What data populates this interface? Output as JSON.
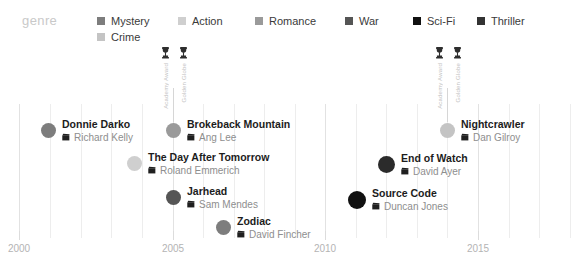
{
  "legend": {
    "title": "genre",
    "items": [
      {
        "label": "Mystery",
        "color": "#7d7d7d",
        "x": 97,
        "y": 15
      },
      {
        "label": "Action",
        "color": "#cfcfcf",
        "x": 178,
        "y": 15
      },
      {
        "label": "Romance",
        "color": "#9a9a9a",
        "x": 255,
        "y": 15
      },
      {
        "label": "War",
        "color": "#555555",
        "x": 345,
        "y": 15
      },
      {
        "label": "Sci-Fi",
        "color": "#111111",
        "x": 413,
        "y": 15
      },
      {
        "label": "Thriller",
        "color": "#333333",
        "x": 477,
        "y": 15
      },
      {
        "label": "Crime",
        "color": "#c4c4c4",
        "x": 97,
        "y": 31
      }
    ]
  },
  "axis": {
    "ticks": [
      {
        "label": "2000",
        "x": 19
      },
      {
        "label": "2005",
        "x": 173
      },
      {
        "label": "2010",
        "x": 325
      },
      {
        "label": "2015",
        "x": 478
      }
    ],
    "minor_gridlines": [
      19,
      50,
      81,
      111,
      142,
      173,
      203,
      234,
      264,
      295,
      325,
      356,
      386,
      417,
      447,
      478,
      509,
      539,
      570
    ]
  },
  "awards": [
    {
      "x": 173,
      "stem_top": 88,
      "stem_height": 34,
      "items_top": 46,
      "entries": [
        {
          "icon": "trophy-icon",
          "label": "Academy Award"
        },
        {
          "icon": "trophy-icon",
          "label": "Golden Globe"
        }
      ]
    },
    {
      "x": 447,
      "stem_top": 88,
      "stem_height": 34,
      "items_top": 46,
      "entries": [
        {
          "icon": "trophy-icon",
          "label": "Academy Award"
        },
        {
          "icon": "trophy-icon",
          "label": "Golden Globe"
        }
      ]
    }
  ],
  "films": [
    {
      "title": "Donnie Darko",
      "director": "Richard Kelly",
      "genre": "Mystery",
      "color": "#7d7d7d",
      "size": 15,
      "x": 41,
      "y": 119
    },
    {
      "title": "Brokeback Mountain",
      "director": "Ang Lee",
      "genre": "Romance",
      "color": "#9a9a9a",
      "size": 15,
      "x": 166,
      "y": 119
    },
    {
      "title": "The Day After Tomorrow",
      "director": "Roland Emmerich",
      "genre": "Action",
      "color": "#cfcfcf",
      "size": 15,
      "x": 127,
      "y": 152
    },
    {
      "title": "Jarhead",
      "director": "Sam Mendes",
      "genre": "War",
      "color": "#555555",
      "size": 15,
      "x": 166,
      "y": 186
    },
    {
      "title": "Zodiac",
      "director": "David Fincher",
      "genre": "Mystery",
      "color": "#7d7d7d",
      "size": 15,
      "x": 216,
      "y": 216
    },
    {
      "title": "Nightcrawler",
      "director": "Dan Gilroy",
      "genre": "Crime",
      "color": "#c4c4c4",
      "size": 15,
      "x": 440,
      "y": 119
    },
    {
      "title": "End of Watch",
      "director": "David Ayer",
      "genre": "Thriller",
      "color": "#2b2b2b",
      "size": 17,
      "x": 378,
      "y": 153
    },
    {
      "title": "Source Code",
      "director": "Duncan Jones",
      "genre": "Sci-Fi",
      "color": "#111111",
      "size": 18,
      "x": 348,
      "y": 188
    }
  ],
  "chart_data": {
    "type": "scatter",
    "title": "",
    "xlabel": "",
    "ylabel": "",
    "xlim": [
      1999,
      2016
    ],
    "grid": true,
    "legend_position": "top",
    "legend_title": "genre",
    "categories": [
      "Mystery",
      "Action",
      "Romance",
      "War",
      "Sci-Fi",
      "Thriller",
      "Crime"
    ],
    "x_tick_labels": [
      "2000",
      "2005",
      "2010",
      "2015"
    ],
    "points": [
      {
        "label": "Donnie Darko",
        "director": "Richard Kelly",
        "genre": "Mystery",
        "year": 2001
      },
      {
        "label": "Brokeback Mountain",
        "director": "Ang Lee",
        "genre": "Romance",
        "year": 2005
      },
      {
        "label": "The Day After Tomorrow",
        "director": "Roland Emmerich",
        "genre": "Action",
        "year": 2004
      },
      {
        "label": "Jarhead",
        "director": "Sam Mendes",
        "genre": "War",
        "year": 2005
      },
      {
        "label": "Zodiac",
        "director": "David Fincher",
        "genre": "Mystery",
        "year": 2007
      },
      {
        "label": "Nightcrawler",
        "director": "Dan Gilroy",
        "genre": "Crime",
        "year": 2014
      },
      {
        "label": "End of Watch",
        "director": "David Ayer",
        "genre": "Thriller",
        "year": 2012
      },
      {
        "label": "Source Code",
        "director": "Duncan Jones",
        "genre": "Sci-Fi",
        "year": 2011
      }
    ],
    "annotations": [
      {
        "year": 2005,
        "labels": [
          "Academy Award",
          "Golden Globe"
        ]
      },
      {
        "year": 2014,
        "labels": [
          "Academy Award",
          "Golden Globe"
        ]
      }
    ]
  }
}
